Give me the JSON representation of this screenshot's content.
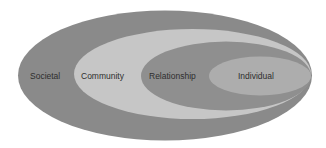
{
  "diagram": {
    "type": "nested-ellipses",
    "levels": [
      {
        "id": "societal",
        "label": "Societal",
        "color": "#8a8a8a"
      },
      {
        "id": "community",
        "label": "Community",
        "color": "#c6c6c6"
      },
      {
        "id": "relationship",
        "label": "Relationship",
        "color": "#8f8f8f"
      },
      {
        "id": "individual",
        "label": "Individual",
        "color": "#adadad"
      }
    ]
  }
}
